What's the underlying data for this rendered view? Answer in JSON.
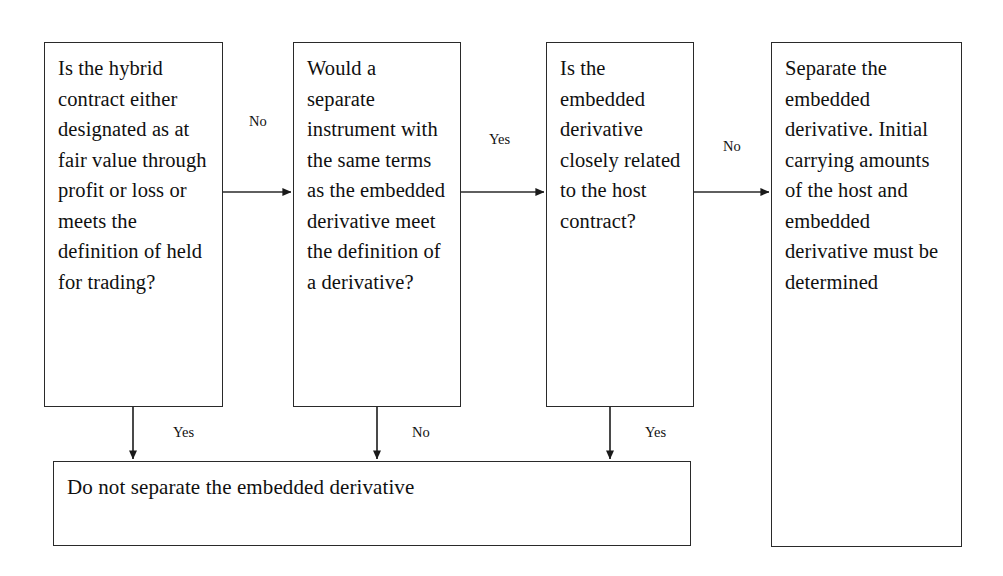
{
  "diagram": {
    "colors": {
      "background": "#ffffff",
      "box_border": "#2a2a2a",
      "text": "#101010",
      "edge_line": "#2a2a2a"
    },
    "nodes": [
      {
        "id": "q1",
        "kind": "question",
        "text": "Is the hybrid contract either designated as at fair value through profit or loss or meets the definition of held for trading?"
      },
      {
        "id": "q2",
        "kind": "question",
        "text": "Would a separate instrument with the same terms as the embedded derivative meet the definition of a derivative?"
      },
      {
        "id": "q3",
        "kind": "question",
        "text": "Is the embedded derivative closely related to the host contract?"
      },
      {
        "id": "a1",
        "kind": "outcome",
        "text": "Separate the embedded derivative. Initial carrying amounts of the host and embedded derivative must be determined"
      },
      {
        "id": "a2",
        "kind": "outcome",
        "text": "Do not separate the embedded derivative"
      }
    ],
    "edges": [
      {
        "id": "e1",
        "from": "q1",
        "to": "q2",
        "label": "No",
        "direction": "right"
      },
      {
        "id": "e2",
        "from": "q2",
        "to": "q3",
        "label": "Yes",
        "direction": "right"
      },
      {
        "id": "e3",
        "from": "q3",
        "to": "a1",
        "label": "No",
        "direction": "right"
      },
      {
        "id": "e4",
        "from": "q1",
        "to": "a2",
        "label": "Yes",
        "direction": "down"
      },
      {
        "id": "e5",
        "from": "q2",
        "to": "a2",
        "label": "No",
        "direction": "down"
      },
      {
        "id": "e6",
        "from": "q3",
        "to": "a2",
        "label": "Yes",
        "direction": "down"
      }
    ]
  }
}
